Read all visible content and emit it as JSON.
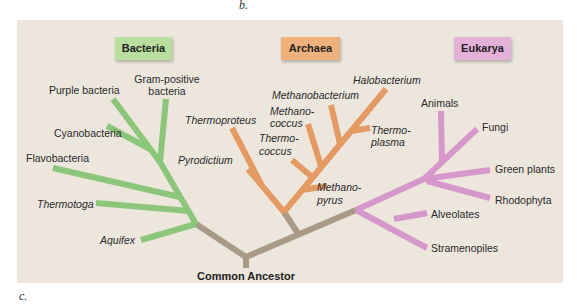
{
  "figure": {
    "top_letter": "b.",
    "bottom_letter": "c.",
    "root_label": "Common Ancestor",
    "colors": {
      "background": "#ece6dd",
      "root": "#a89a84",
      "bacteria": "#8cc67a",
      "bacteria_box": "#b8dea0",
      "archaea": "#e59a64",
      "archaea_box": "#efb17c",
      "eukarya": "#d698cc",
      "eukarya_box": "#e4b2d8"
    },
    "domains": [
      {
        "name": "Bacteria",
        "taxa": [
          "Purple bacteria",
          "Gram-positive bacteria",
          "Cyanobacteria",
          "Flavobacteria",
          "Thermotoga",
          "Aquifex"
        ],
        "labels": {
          "purple": "Purple bacteria",
          "gram1": "Gram-positive",
          "gram2": "bacteria",
          "cyano": "Cyanobacteria",
          "flavo": "Flavobacteria",
          "thermotoga": "Thermotoga",
          "aquifex": "Aquifex"
        }
      },
      {
        "name": "Archaea",
        "taxa": [
          "Halobacterium",
          "Methanobacterium",
          "Methanococcus",
          "Thermoproteus",
          "Thermococcus",
          "Thermoplasma",
          "Pyrodictium",
          "Methanopyrus"
        ],
        "labels": {
          "halo": "Halobacterium",
          "methanobact": "Methanobacterium",
          "methanococ1": "Methano-",
          "methanococ2": "coccus",
          "thermoproteus": "Thermoproteus",
          "thermococ1": "Thermo-",
          "thermococ2": "coccus",
          "thermoplasma1": "Thermo-",
          "thermoplasma2": "plasma",
          "pyrodictium": "Pyrodictium",
          "methanopyrus1": "Methano-",
          "methanopyrus2": "pyrus"
        }
      },
      {
        "name": "Eukarya",
        "taxa": [
          "Animals",
          "Fungi",
          "Green plants",
          "Rhodophyta",
          "Alveolates",
          "Stramenopiles"
        ],
        "labels": {
          "animals": "Animals",
          "fungi": "Fungi",
          "green": "Green plants",
          "rhodo": "Rhodophyta",
          "alveolates": "Alveolates",
          "strameno": "Stramenopiles"
        }
      }
    ]
  }
}
